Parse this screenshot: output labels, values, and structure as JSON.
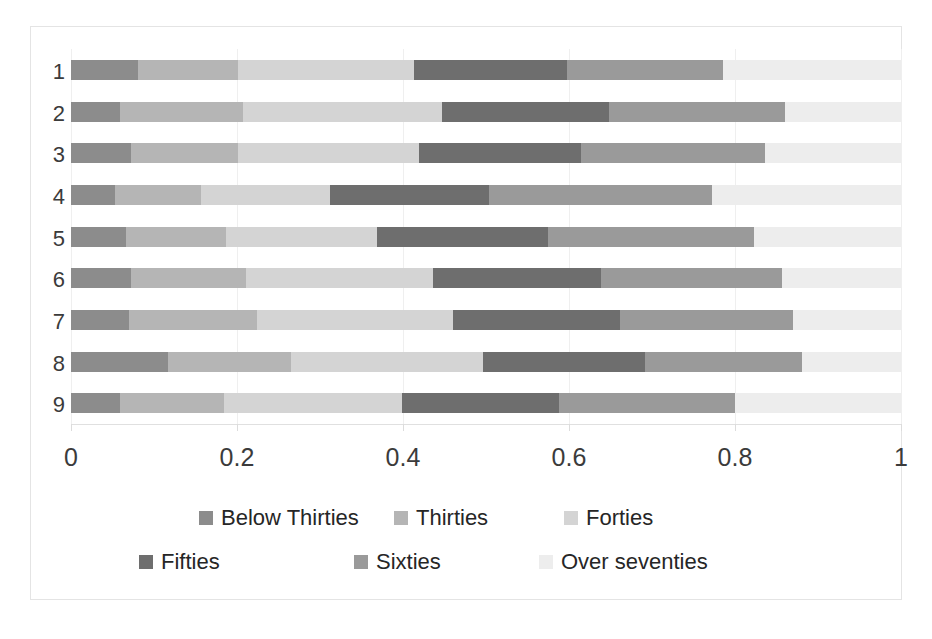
{
  "chart_data": {
    "type": "bar",
    "orientation": "horizontal",
    "stacked": true,
    "normalized": true,
    "title": "",
    "subtitle": "",
    "xlabel": "",
    "ylabel": "",
    "xlim": [
      0,
      1
    ],
    "xticks": [
      "0",
      "0.2",
      "0.4",
      "0.6",
      "0.8",
      "1"
    ],
    "xtick_values": [
      0,
      0.2,
      0.4,
      0.6,
      0.8,
      1
    ],
    "grid": true,
    "grid_axis": "x",
    "legend_position": "bottom",
    "categories": [
      "1",
      "2",
      "3",
      "4",
      "5",
      "6",
      "7",
      "8",
      "9"
    ],
    "series": [
      {
        "name": "Below Thirties",
        "color": "#8c8c8c",
        "values": [
          0.081,
          0.059,
          0.072,
          0.053,
          0.066,
          0.072,
          0.07,
          0.117,
          0.059
        ]
      },
      {
        "name": "Thirties",
        "color": "#b5b5b5",
        "values": [
          0.12,
          0.148,
          0.129,
          0.104,
          0.121,
          0.139,
          0.154,
          0.148,
          0.125
        ]
      },
      {
        "name": "Forties",
        "color": "#d4d4d4",
        "values": [
          0.212,
          0.24,
          0.218,
          0.155,
          0.182,
          0.225,
          0.236,
          0.231,
          0.215
        ]
      },
      {
        "name": "Fifties",
        "color": "#6e6e6e",
        "values": [
          0.185,
          0.201,
          0.195,
          0.192,
          0.206,
          0.203,
          0.202,
          0.196,
          0.189
        ]
      },
      {
        "name": "Sixties",
        "color": "#9a9a9a",
        "values": [
          0.188,
          0.212,
          0.222,
          0.268,
          0.248,
          0.218,
          0.208,
          0.189,
          0.212
        ]
      },
      {
        "name": "Over seventies",
        "color": "#ededed",
        "values": [
          0.214,
          0.14,
          0.164,
          0.228,
          0.177,
          0.143,
          0.13,
          0.119,
          0.2
        ]
      }
    ],
    "cumulative_boundaries": [
      [
        0.081,
        0.201,
        0.413,
        0.598,
        0.786,
        1.0
      ],
      [
        0.059,
        0.207,
        0.447,
        0.648,
        0.86,
        1.0
      ],
      [
        0.072,
        0.201,
        0.419,
        0.614,
        0.836,
        1.0
      ],
      [
        0.053,
        0.157,
        0.312,
        0.504,
        0.772,
        1.0
      ],
      [
        0.066,
        0.187,
        0.369,
        0.575,
        0.823,
        1.0
      ],
      [
        0.072,
        0.211,
        0.436,
        0.639,
        0.857,
        1.0
      ],
      [
        0.07,
        0.224,
        0.46,
        0.662,
        0.87,
        1.0
      ],
      [
        0.117,
        0.265,
        0.496,
        0.692,
        0.881,
        1.0
      ],
      [
        0.059,
        0.184,
        0.399,
        0.588,
        0.8,
        1.0
      ]
    ]
  },
  "legend": {
    "rows": [
      [
        {
          "label": "Below Thirties",
          "color": "#8c8c8c",
          "x": 60
        },
        {
          "label": "Thirties",
          "color": "#b5b5b5",
          "x": 255
        },
        {
          "label": "Forties",
          "color": "#d4d4d4",
          "x": 425
        }
      ],
      [
        {
          "label": "Fifties",
          "color": "#6e6e6e",
          "x": 0
        },
        {
          "label": "Sixties",
          "color": "#9a9a9a",
          "x": 215
        },
        {
          "label": "Over seventies",
          "color": "#ededed",
          "x": 400
        }
      ]
    ]
  },
  "colors": {
    "background": "#ffffff",
    "text": "#3b3b3b",
    "gridline": "#efefef",
    "axis": "#e0e0e0",
    "card_border": "#e4e4e4"
  }
}
